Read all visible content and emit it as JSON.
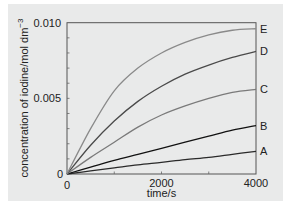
{
  "chart_data": {
    "type": "line",
    "title": "",
    "xlabel": "time/s",
    "ylabel": "concentration of iodine/mol dm",
    "ylabel_superscript": "−3",
    "xlim": [
      0,
      4000
    ],
    "ylim": [
      0,
      0.01
    ],
    "x_ticks": [
      0,
      1000,
      2000,
      3000,
      4000
    ],
    "x_tick_labels": [
      "0",
      "",
      "2000",
      "",
      "4000"
    ],
    "y_ticks": [
      0,
      0.001,
      0.002,
      0.003,
      0.004,
      0.005,
      0.006,
      0.007,
      0.008,
      0.009,
      0.01
    ],
    "y_tick_labels": {
      "0": "0",
      "0.005": "0.005",
      "0.010": "0.010"
    },
    "x_origin_label": "0",
    "grid": false,
    "legend": "inline labels at right end of curves",
    "x": [
      0,
      500,
      1000,
      1500,
      2000,
      2500,
      3000,
      3500,
      4000
    ],
    "series": [
      {
        "name": "A",
        "color": "#2a2a2a",
        "values": [
          0,
          0.0002,
          0.0004,
          0.0006,
          0.00077,
          0.00095,
          0.0011,
          0.0013,
          0.0015
        ]
      },
      {
        "name": "B",
        "color": "#111111",
        "values": [
          0,
          0.00045,
          0.0009,
          0.0013,
          0.0017,
          0.0021,
          0.0025,
          0.0029,
          0.0032
        ]
      },
      {
        "name": "C",
        "color": "#7a7a7a",
        "values": [
          0,
          0.0011,
          0.0021,
          0.0031,
          0.0039,
          0.0045,
          0.005,
          0.0054,
          0.0056
        ]
      },
      {
        "name": "D",
        "color": "#4a4a4a",
        "values": [
          0,
          0.0019,
          0.0035,
          0.0048,
          0.0058,
          0.0066,
          0.0072,
          0.0077,
          0.0081
        ]
      },
      {
        "name": "E",
        "color": "#8a8a8a",
        "values": [
          0,
          0.003,
          0.0055,
          0.007,
          0.008,
          0.0087,
          0.0092,
          0.0095,
          0.0096
        ]
      }
    ]
  }
}
